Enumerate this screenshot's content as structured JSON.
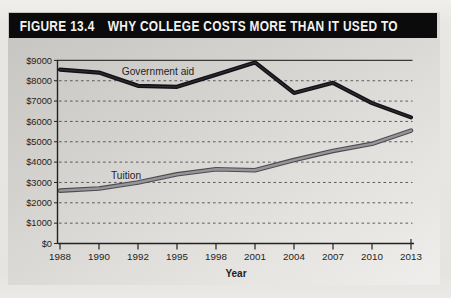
{
  "figure": {
    "label": "FIGURE 13.4",
    "title": "WHY COLLEGE COSTS MORE THAN IT USED TO"
  },
  "chart_data": {
    "type": "line",
    "title": "Why College Costs More Than It Used To",
    "xlabel": "Year",
    "ylabel": "",
    "categories": [
      "1988",
      "1990",
      "1992",
      "1995",
      "1998",
      "2001",
      "2004",
      "2007",
      "2010",
      "2013"
    ],
    "series": [
      {
        "name": "Government aid",
        "color": "#121216",
        "values": [
          8550,
          8400,
          7750,
          7700,
          8300,
          8900,
          7400,
          7900,
          6900,
          6200
        ]
      },
      {
        "name": "Tuition",
        "color": "#96969a",
        "values": [
          2600,
          2700,
          3000,
          3400,
          3650,
          3600,
          4100,
          4550,
          4900,
          5550
        ]
      }
    ],
    "y_tick_labels": [
      "$0",
      "$1000",
      "$2000",
      "$3000",
      "$4000",
      "$5000",
      "$6000",
      "$7000",
      "$8000",
      "$9000"
    ],
    "ylim": [
      0,
      9000
    ],
    "y_tick_step": 1000,
    "grid": "horizontal-dashed",
    "legend_position": "inline-labels"
  },
  "colors": {
    "header_bg": "#0b0b0b",
    "header_text": "#f2f2f2",
    "axis": "#222222",
    "grid": "#4c4c4c",
    "government_aid_line": "#121216",
    "tuition_line_core": "#96969a",
    "tuition_line_edge": "#4c4c50"
  }
}
